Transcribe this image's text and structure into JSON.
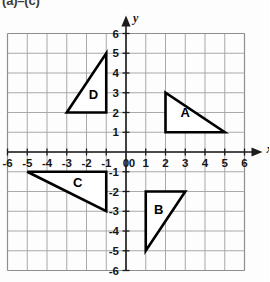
{
  "caption": {
    "text": "(a)–(c)"
  },
  "chart_data": {
    "type": "scatter",
    "title": "",
    "xlabel": "x",
    "ylabel": "y",
    "xlim": [
      -6,
      6
    ],
    "ylim": [
      -6,
      6
    ],
    "grid": true,
    "grid_step": 1,
    "legend": "none",
    "x_ticks": [
      -6,
      -5,
      -4,
      -3,
      -2,
      -1,
      0,
      1,
      2,
      3,
      4,
      5,
      6
    ],
    "y_ticks": [
      6,
      5,
      4,
      3,
      2,
      1,
      -1,
      -2,
      -3,
      -4,
      -5,
      -6
    ],
    "x_tick_labels": [
      "-6",
      "-5",
      "-4",
      "-3",
      "-2",
      "-1",
      "0",
      "1",
      "2",
      "3",
      "4",
      "5",
      "6"
    ],
    "y_tick_labels": [
      "6",
      "5",
      "4",
      "3",
      "2",
      "1",
      "-1",
      "-2",
      "-3",
      "-4",
      "-5",
      "-6"
    ],
    "origin_label": "0",
    "axis_arrows": [
      "x-positive",
      "y-positive"
    ],
    "shapes": [
      {
        "name": "A",
        "kind": "right-triangle",
        "vertices": [
          [
            2,
            3
          ],
          [
            2,
            1
          ],
          [
            5,
            1
          ]
        ],
        "label": "A",
        "label_at": [
          3.0,
          1.75
        ],
        "fill": "#ffffff",
        "stroke": "#000000"
      },
      {
        "name": "B",
        "kind": "right-triangle",
        "vertices": [
          [
            1,
            -2
          ],
          [
            3,
            -2
          ],
          [
            1,
            -5
          ]
        ],
        "label": "B",
        "label_at": [
          1.65,
          -3.15
        ],
        "fill": "#ffffff",
        "stroke": "#000000"
      },
      {
        "name": "C",
        "kind": "right-triangle",
        "vertices": [
          [
            -5,
            -1
          ],
          [
            -1,
            -1
          ],
          [
            -1,
            -3
          ]
        ],
        "label": "C",
        "label_at": [
          -2.45,
          -1.75
        ],
        "fill": "#ffffff",
        "stroke": "#000000"
      },
      {
        "name": "D",
        "kind": "right-triangle",
        "vertices": [
          [
            -3,
            2
          ],
          [
            -1,
            2
          ],
          [
            -1,
            5
          ]
        ],
        "label": "D",
        "label_at": [
          -1.65,
          2.7
        ],
        "fill": "#ffffff",
        "stroke": "#000000"
      }
    ],
    "colors": {
      "grid": "#a9a9ad",
      "axis": "#1c1c1c",
      "shape_stroke": "#000000",
      "shape_fill": "#ffffff",
      "background": "#fdfdfd"
    }
  }
}
